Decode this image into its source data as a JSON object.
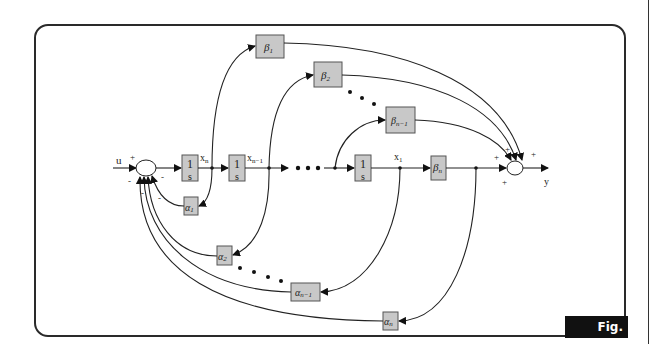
{
  "figure": {
    "label": "Fig. E.12"
  },
  "diagram": {
    "input_label": "u",
    "output_label": "y",
    "integrators": [
      {
        "num": "1",
        "den": "s",
        "output": "x",
        "output_sub": "n"
      },
      {
        "num": "1",
        "den": "s",
        "output": "x",
        "output_sub": "n−1"
      },
      {
        "num": "1",
        "den": "s",
        "output": "x",
        "output_sub": "1"
      }
    ],
    "feedforward_gains": [
      {
        "sym": "β",
        "sub": "1"
      },
      {
        "sym": "β",
        "sub": "2"
      },
      {
        "sym": "β",
        "sub": "n−1"
      },
      {
        "sym": "β",
        "sub": "n"
      }
    ],
    "feedback_gains": [
      {
        "sym": "α",
        "sub": "1"
      },
      {
        "sym": "α",
        "sub": "2"
      },
      {
        "sym": "α",
        "sub": "n−1"
      },
      {
        "sym": "α",
        "sub": "n"
      }
    ],
    "input_sum_signs": {
      "u": "+",
      "feedback": "-"
    },
    "output_sum_signs": {
      "inputs": "+"
    },
    "ellipsis": "• • •"
  }
}
